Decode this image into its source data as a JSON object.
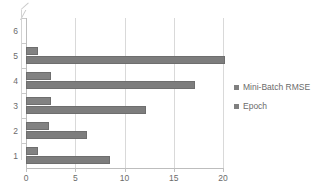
{
  "chart_data": {
    "type": "bar",
    "orientation": "horizontal",
    "title": "",
    "xlabel": "",
    "ylabel": "",
    "categories": [
      "1",
      "2",
      "3",
      "4",
      "5"
    ],
    "series": [
      {
        "name": "Mini-Batch RMSE",
        "values": [
          1.2,
          2.3,
          2.5,
          2.5,
          1.2
        ],
        "color": "#808080"
      },
      {
        "name": "Epoch",
        "values": [
          8.5,
          6.2,
          12.2,
          17.2,
          20.2
        ],
        "color": "#808080"
      }
    ],
    "xlim": [
      0,
      20
    ],
    "ylim_categories": [
      "1",
      "2",
      "3",
      "4",
      "5",
      "6"
    ],
    "x_ticks": [
      "0",
      "5",
      "10",
      "15",
      "20"
    ],
    "y_ticks": [
      "1",
      "2",
      "3",
      "4",
      "5",
      "6"
    ],
    "grid": "vertical",
    "legend_position": "right"
  },
  "legend": {
    "items": [
      {
        "label": "Mini-Batch RMSE",
        "swatch": "legend-swatch-icon"
      },
      {
        "label": "Epoch",
        "swatch": "legend-swatch-icon"
      }
    ]
  },
  "axes": {
    "x_tick_labels": [
      "0",
      "5",
      "10",
      "15",
      "20"
    ],
    "y_tick_labels": [
      "6",
      "5",
      "4",
      "3",
      "2",
      "1"
    ]
  },
  "colors": {
    "bar": "#808080",
    "gridline": "#d9d9d9",
    "axis": "#bdbdbd",
    "text": "#6b6b6b",
    "background": "#ffffff"
  }
}
